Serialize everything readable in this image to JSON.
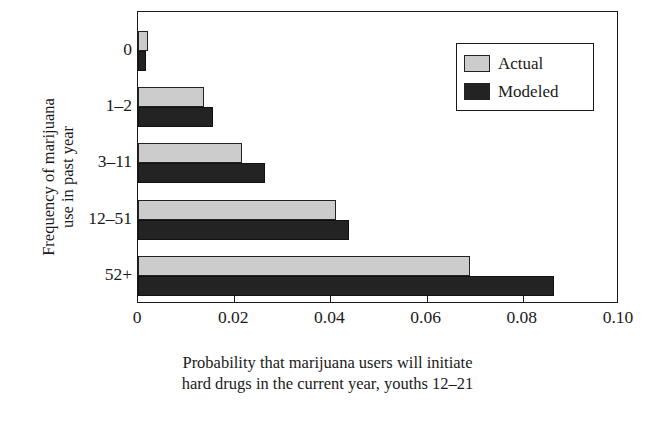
{
  "chart_data": {
    "type": "bar",
    "orientation": "horizontal",
    "title": "",
    "xlabel": "Probability that marijuana users will initiate hard drugs in the current year, youths 12–21",
    "xlabel_lines": [
      "Probability that marijuana users will initiate",
      "hard drugs in the current year, youths 12–21"
    ],
    "ylabel": "Frequency of marijuana use in past year",
    "ylabel_lines": [
      "Frequency of marijuana",
      "use in past year"
    ],
    "categories": [
      "0",
      "1–2",
      "3–11",
      "12–51",
      "52+"
    ],
    "series": [
      {
        "name": "Actual",
        "color": "#cccccc",
        "values": [
          0.002,
          0.0137,
          0.0216,
          0.0412,
          0.069
        ]
      },
      {
        "name": "Modeled",
        "color": "#232323",
        "values": [
          0.0016,
          0.0156,
          0.0264,
          0.0439,
          0.0865
        ]
      }
    ],
    "xlim": [
      0,
      0.1
    ],
    "xticks": [
      0,
      0.02,
      0.04,
      0.06,
      0.08,
      0.1
    ],
    "xtick_labels": [
      "0",
      "0.02",
      "0.04",
      "0.06",
      "0.08",
      "0.10"
    ],
    "grid": false,
    "legend_position": "upper right",
    "legend_entries": [
      "Actual",
      "Modeled"
    ]
  }
}
